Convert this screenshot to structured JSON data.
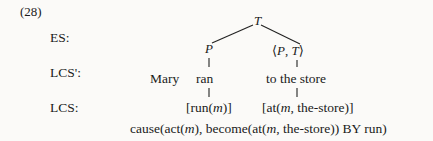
{
  "example": {
    "number": "(28)"
  },
  "rows": {
    "es_label": "ES:",
    "lcs_prime_label": "LCS':",
    "lcs_label": "LCS:"
  },
  "tree": {
    "root_label": "T",
    "left_child_label": "P",
    "right_child_open": "⟨",
    "right_child_first": "P",
    "right_child_sep": ",",
    "right_child_second": "T",
    "right_child_close": "⟩",
    "right_child_full": "⟨P, T⟩"
  },
  "sentence": {
    "subject": "Mary",
    "verb": "ran",
    "pp": "to the store",
    "full": "Mary ran to the store"
  },
  "lcs": {
    "verb_formula_open": "[run(",
    "verb_formula_var": "m",
    "verb_formula_close": ")]",
    "verb_formula_full": "[run(m)]",
    "pp_formula_open": "[at(",
    "pp_formula_var": "m",
    "pp_formula_mid": ", the-store)]",
    "pp_formula_full": "[at(m, the-store)]",
    "composed_part1": "cause(act(",
    "composed_var1": "m",
    "composed_part2": "), become(at(",
    "composed_var2": "m",
    "composed_part3": ", the-store)) BY run)",
    "composed_full": "cause(act(m), become(at(m, the-store)) BY run)"
  },
  "colors": {
    "background": "#fbfaf8",
    "text": "#1a1a1a",
    "line": "#222222"
  }
}
